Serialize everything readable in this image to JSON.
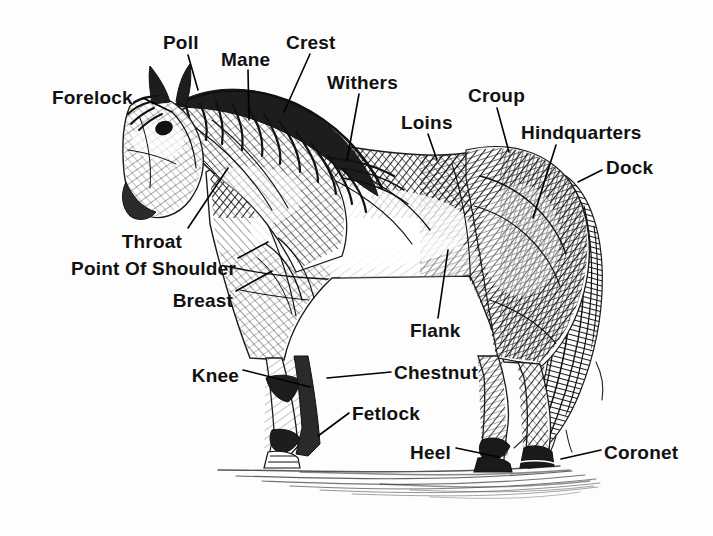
{
  "diagram": {
    "style": "pen-and-ink crosshatch sketch",
    "background_color": "#fdfdfd",
    "ink_color": "#1a1a1a",
    "label_color": "#111111",
    "leader_line_color": "#000000"
  },
  "labels": [
    {
      "id": "forelock",
      "text": "Forelock",
      "x": 52,
      "y": 88,
      "align": "left",
      "leader": {
        "x1": 143,
        "y1": 98,
        "x2": 172,
        "y2": 112
      }
    },
    {
      "id": "poll",
      "text": "Poll",
      "x": 163,
      "y": 33,
      "align": "left",
      "leader": {
        "x1": 188,
        "y1": 55,
        "x2": 198,
        "y2": 90
      }
    },
    {
      "id": "mane",
      "text": "Mane",
      "x": 221,
      "y": 50,
      "align": "left",
      "leader": {
        "x1": 248,
        "y1": 70,
        "x2": 249,
        "y2": 120
      }
    },
    {
      "id": "crest",
      "text": "Crest",
      "x": 286,
      "y": 33,
      "align": "left",
      "leader": {
        "x1": 310,
        "y1": 54,
        "x2": 284,
        "y2": 112
      }
    },
    {
      "id": "withers",
      "text": "Withers",
      "x": 327,
      "y": 73,
      "align": "left",
      "leader": {
        "x1": 359,
        "y1": 94,
        "x2": 347,
        "y2": 160
      }
    },
    {
      "id": "loins",
      "text": "Loins",
      "x": 401,
      "y": 113,
      "align": "left",
      "leader": {
        "x1": 428,
        "y1": 134,
        "x2": 437,
        "y2": 160
      }
    },
    {
      "id": "croup",
      "text": "Croup",
      "x": 468,
      "y": 86,
      "align": "left",
      "leader": {
        "x1": 497,
        "y1": 108,
        "x2": 509,
        "y2": 152
      }
    },
    {
      "id": "hindquarters",
      "text": "Hindquarters",
      "x": 521,
      "y": 123,
      "align": "left",
      "leader": {
        "x1": 556,
        "y1": 145,
        "x2": 533,
        "y2": 218
      }
    },
    {
      "id": "dock",
      "text": "Dock",
      "x": 606,
      "y": 158,
      "align": "left",
      "leader": {
        "x1": 602,
        "y1": 170,
        "x2": 578,
        "y2": 182
      }
    },
    {
      "id": "throat",
      "text": "Throat",
      "x": 182,
      "y": 232,
      "align": "right",
      "leader": {
        "x1": 188,
        "y1": 228,
        "x2": 228,
        "y2": 168
      }
    },
    {
      "id": "point-of-shoulder",
      "text": "Point Of Shoulder",
      "x": 236,
      "y": 259,
      "align": "right",
      "leader": {
        "x1": 238,
        "y1": 258,
        "x2": 268,
        "y2": 242
      }
    },
    {
      "id": "breast",
      "text": "Breast",
      "x": 233,
      "y": 291,
      "align": "right",
      "leader": {
        "x1": 236,
        "y1": 291,
        "x2": 272,
        "y2": 271
      }
    },
    {
      "id": "flank",
      "text": "Flank",
      "x": 410,
      "y": 321,
      "align": "left",
      "leader": {
        "x1": 438,
        "y1": 318,
        "x2": 448,
        "y2": 250
      }
    },
    {
      "id": "knee",
      "text": "Knee",
      "x": 239,
      "y": 366,
      "align": "right",
      "leader": {
        "x1": 243,
        "y1": 370,
        "x2": 310,
        "y2": 387
      }
    },
    {
      "id": "chestnut",
      "text": "Chestnut",
      "x": 394,
      "y": 363,
      "align": "left",
      "leader": {
        "x1": 391,
        "y1": 372,
        "x2": 327,
        "y2": 378
      }
    },
    {
      "id": "fetlock",
      "text": "Fetlock",
      "x": 352,
      "y": 404,
      "align": "left",
      "leader": {
        "x1": 349,
        "y1": 413,
        "x2": 318,
        "y2": 436
      }
    },
    {
      "id": "heel",
      "text": "Heel",
      "x": 451,
      "y": 443,
      "align": "right",
      "leader": {
        "x1": 456,
        "y1": 448,
        "x2": 499,
        "y2": 457
      }
    },
    {
      "id": "coronet",
      "text": "Coronet",
      "x": 604,
      "y": 443,
      "align": "left",
      "leader": {
        "x1": 601,
        "y1": 450,
        "x2": 561,
        "y2": 459
      }
    }
  ]
}
